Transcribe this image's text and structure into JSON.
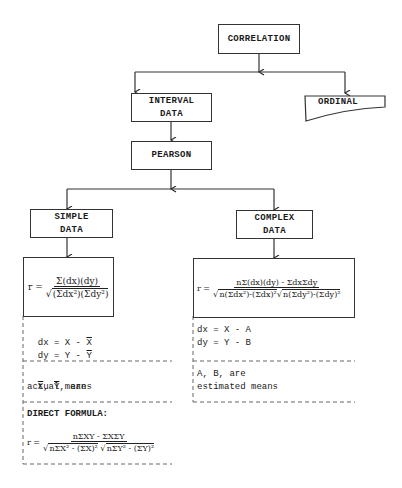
{
  "nodes": {
    "correlation": "CORRELATION",
    "interval_line1": "INTERVAL",
    "interval_line2": "DATA",
    "ordinal": "ORDINAL",
    "pearson": "PEARSON",
    "simple_line1": "SIMPLE",
    "simple_line2": "DATA",
    "complex_line1": "COMPLEX",
    "complex_line2": "DATA"
  },
  "simple": {
    "formula_lhs": "r =",
    "formula_num": "Σ(dx)(dy)",
    "formula_den": "(Σdx²)(Σdy²)",
    "dx": "dx = X - X̄",
    "dy_prefix": "dy = Y - ",
    "dx_prefix": "dx = X - ",
    "xbar": "X",
    "ybar": "Y",
    "means_line1_suffix": ", are",
    "means_line2": "actual means",
    "direct_label": "DIRECT FORMULA:",
    "direct_lhs": "r =",
    "direct_num": "nΣXY - ΣXΣY",
    "direct_den_a": "nΣX² - (ΣX)²",
    "direct_den_b": "nΣY² - (ΣY)²"
  },
  "complex": {
    "formula_lhs": "r =",
    "formula_num": "nΣ(dx)(dy) - ΣdxΣdy",
    "formula_den_a": "n(Σdx²)-(Σdx)²",
    "formula_den_b": "n(Σdy²)-(Σdy)²",
    "dx": "dx = X - A",
    "dy": "dy = Y - B",
    "means_line1": "A, B, are",
    "means_line2": "estimated means"
  }
}
